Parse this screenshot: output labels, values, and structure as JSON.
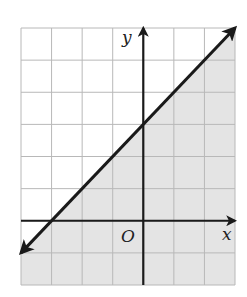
{
  "chart_data": {
    "type": "line",
    "title": "",
    "xlabel": "x",
    "ylabel": "y",
    "origin_label": "O",
    "xlim": [
      -4,
      3
    ],
    "ylim": [
      -2,
      6
    ],
    "grid": true,
    "grid_step": 1,
    "tick_labels_shown": false,
    "series": [
      {
        "name": "boundary line",
        "equation": "y = x + 3",
        "slope": 1,
        "y_intercept": 3,
        "x_intercept": -3,
        "line_style": "solid",
        "arrows": "both ends",
        "points": [
          [
            -4,
            -1
          ],
          [
            -3,
            0
          ],
          [
            0,
            3
          ],
          [
            3,
            6
          ]
        ]
      }
    ],
    "shaded_region": {
      "inequality": "y <= x + 3",
      "side": "below/right of the line",
      "boundary_included": true
    }
  },
  "colors": {
    "background": "#ffffff",
    "grid": "#b8b8b8",
    "shade": "#e4e4e4",
    "line": "#1a1a1a",
    "axis": "#1a1a1a"
  },
  "labels": {
    "x_axis": "x",
    "y_axis": "y",
    "origin": "O"
  }
}
